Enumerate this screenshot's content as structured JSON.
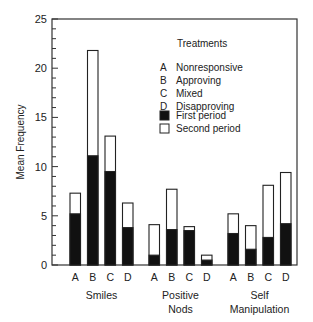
{
  "chart_data": {
    "type": "bar",
    "stacked": true,
    "title": "",
    "xlabel": "",
    "ylabel": "Mean Frequency",
    "ylim": [
      0,
      25
    ],
    "yticks": [
      0,
      5,
      10,
      15,
      20,
      25
    ],
    "minor_tick_step": 1,
    "grid": false,
    "legend_position": "upper right (inside plot)",
    "legend_title": "Treatments",
    "treatments": [
      {
        "code": "A",
        "label": "Nonresponsive"
      },
      {
        "code": "B",
        "label": "Approving"
      },
      {
        "code": "C",
        "label": "Mixed"
      },
      {
        "code": "D",
        "label": "Disapproving"
      }
    ],
    "series_legend": [
      {
        "name": "First period",
        "color": "#111111"
      },
      {
        "name": "Second period",
        "color": "#ffffff"
      }
    ],
    "groups": [
      {
        "name": "Smiles",
        "label_lines": [
          "Smiles"
        ],
        "categories": [
          "A",
          "B",
          "C",
          "D"
        ],
        "first_period": [
          5.2,
          11.1,
          9.5,
          3.8
        ],
        "total": [
          7.3,
          21.8,
          13.1,
          6.3
        ],
        "second_period": [
          2.1,
          10.7,
          3.6,
          2.5
        ]
      },
      {
        "name": "Positive Nods",
        "label_lines": [
          "Positive",
          "Nods"
        ],
        "categories": [
          "A",
          "B",
          "C",
          "D"
        ],
        "first_period": [
          1.0,
          3.6,
          3.5,
          0.5
        ],
        "total": [
          4.1,
          7.7,
          3.9,
          1.0
        ],
        "second_period": [
          3.1,
          4.1,
          0.4,
          0.5
        ]
      },
      {
        "name": "Self Manipulation",
        "label_lines": [
          "Self",
          "Manipulation"
        ],
        "categories": [
          "A",
          "B",
          "C",
          "D"
        ],
        "first_period": [
          3.2,
          1.6,
          2.8,
          4.2
        ],
        "total": [
          5.2,
          4.0,
          8.1,
          9.4
        ],
        "second_period": [
          2.0,
          2.4,
          5.3,
          5.2
        ]
      }
    ]
  },
  "colors": {
    "axis": "#333333",
    "first_period_fill": "#111111",
    "second_period_fill": "#ffffff",
    "bar_stroke": "#222222",
    "text": "#222222"
  }
}
